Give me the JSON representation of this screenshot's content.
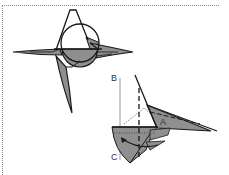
{
  "colors": {
    "background": "#ffffff",
    "fill_gray": "#8f8f8f",
    "fill_light": "#b5b5b5",
    "line": "#1a1a1a",
    "border_dots": "#8a8a8a"
  },
  "figure1": {
    "description": "star-shaped fold with circle guide"
  },
  "figure2": {
    "description": "fold step with rotation arrow",
    "labels": {
      "a": "A",
      "b": "B",
      "c": "C"
    }
  }
}
